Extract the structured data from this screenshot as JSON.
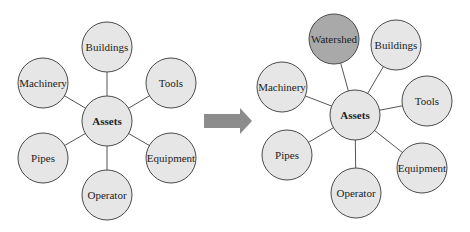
{
  "colors": {
    "node_fill": "#e6e6e6",
    "highlight_fill": "#a9a9a9",
    "stroke": "#4a4a4a",
    "arrow": "#8c8c8c"
  },
  "left": {
    "center": "Assets",
    "nodes": [
      "Buildings",
      "Tools",
      "Equipment",
      "Operator",
      "Pipes",
      "Machinery"
    ]
  },
  "arrow": {
    "direction": "right"
  },
  "right": {
    "center": "Assets",
    "nodes": [
      "Watershed",
      "Buildings",
      "Tools",
      "Equipment",
      "Operator",
      "Pipes",
      "Machinery"
    ],
    "highlighted": "Watershed"
  }
}
